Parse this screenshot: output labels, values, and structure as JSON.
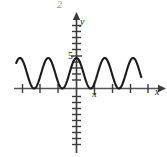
{
  "figure": {
    "title_marker": "2",
    "axis_labels": {
      "x": "x",
      "y": "y"
    },
    "tick_labels": {
      "y_five": "5",
      "x_pi": "π"
    },
    "colors": {
      "curve": "#1a1a1a",
      "axis": "#555555",
      "background": "#ffffff",
      "marker": "#8d8d8d"
    }
  },
  "chart_data": {
    "type": "line",
    "title": "",
    "xlabel": "x",
    "ylabel": "y",
    "grid": false,
    "legend": null,
    "annotations": [
      "2",
      "5",
      "π"
    ],
    "xlim": [
      -4.2,
      5.2
    ],
    "ylim": [
      -13,
      11
    ],
    "x_ticks": [
      -4,
      -3,
      -2,
      -1,
      0,
      1,
      2,
      3,
      4
    ],
    "y_ticks": [
      -12,
      -11,
      -10,
      -9,
      -8,
      -7,
      -6,
      -5,
      -4,
      -3,
      -2,
      -1,
      0,
      1,
      2,
      3,
      4,
      5,
      6,
      7,
      8,
      9,
      10
    ],
    "labeled_y_ticks": [
      5
    ],
    "labeled_x_ticks": [
      1
    ],
    "series": [
      {
        "name": "y",
        "function": "5 + 5*cos(4x)",
        "midline": 5,
        "amplitude": 5,
        "period": 1.5708,
        "x_start": -3.35,
        "x_end": 3.6,
        "x": [
          -3.35,
          -3.15,
          -2.96,
          -2.76,
          -2.57,
          -2.37,
          -2.18,
          -1.98,
          -1.79,
          -1.59,
          -1.4,
          -1.2,
          -1.01,
          -0.81,
          -0.62,
          -0.42,
          -0.23,
          -0.03,
          0.16,
          0.36,
          0.55,
          0.75,
          0.94,
          1.14,
          1.33,
          1.53,
          1.72,
          1.92,
          2.11,
          2.31,
          2.5,
          2.7,
          2.89,
          3.09,
          3.28,
          3.48,
          3.6
        ],
        "y": [
          10,
          5,
          0,
          5,
          10,
          5,
          0,
          5,
          10,
          5,
          0,
          5,
          10,
          5,
          0,
          5,
          10,
          5,
          0,
          5,
          10,
          5,
          0,
          5,
          10,
          5,
          0,
          5,
          10,
          5,
          0,
          5,
          10,
          5,
          0,
          5,
          7
        ]
      }
    ]
  }
}
